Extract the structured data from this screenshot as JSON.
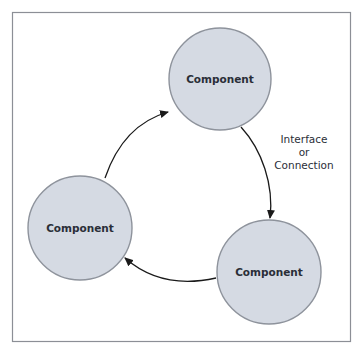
{
  "diagram": {
    "type": "cycle",
    "colors": {
      "frame": "#8c8f96",
      "node_fill": "#d5dae3",
      "node_stroke": "#8e939c",
      "arrow": "#1a1a1a",
      "text": "#2a2e38"
    },
    "nodes": [
      {
        "id": "top",
        "label": "Component"
      },
      {
        "id": "left",
        "label": "Component"
      },
      {
        "id": "right",
        "label": "Component"
      }
    ],
    "edges": [
      {
        "from": "left",
        "to": "top"
      },
      {
        "from": "top",
        "to": "right",
        "label_lines": [
          "Interface",
          "or",
          "Connection"
        ]
      },
      {
        "from": "right",
        "to": "left"
      }
    ]
  }
}
